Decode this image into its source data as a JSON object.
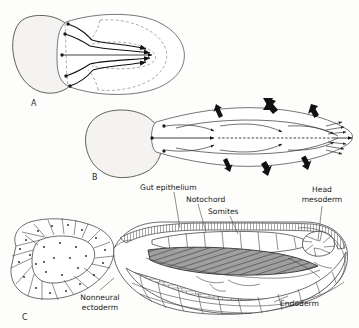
{
  "figure": {
    "background_color": "#fdfdfc",
    "ink_color": "#1b1b1b"
  },
  "panels": [
    {
      "id": "A",
      "letter": "A",
      "caption": "Dorsal view of early neurula with convergent extension arrows"
    },
    {
      "id": "B",
      "letter": "B",
      "caption": "Dorsal view of elongating neurula with convergence arrows"
    },
    {
      "id": "C",
      "letter": "C",
      "caption": "Sagittal section of neurula showing germ layers"
    }
  ],
  "labels": {
    "gut_epithelium": "Gut epithelium",
    "notochord": "Notochord",
    "somites": "Somites",
    "head_mesoderm_line1": "Head",
    "head_mesoderm_line2": "mesoderm",
    "nonneural_ectoderm_line1": "Nonneural",
    "nonneural_ectoderm_line2": "ectoderm",
    "endoderm": "Endoderm"
  },
  "colors": {
    "blob_fill": "#f4f3f1",
    "blob_stroke": "#3a3a3a",
    "outline_stroke": "#4a4a4a",
    "dashed_stroke": "#8a8a8a",
    "arrow_black": "#111111",
    "notochord_gray": "#9b9b9b",
    "text": "#1b1b1b"
  },
  "icon_names": [
    "arrow-thick-down-icon",
    "arrow-thick-up-icon",
    "arrow-thin-icon",
    "leader-line-icon"
  ]
}
